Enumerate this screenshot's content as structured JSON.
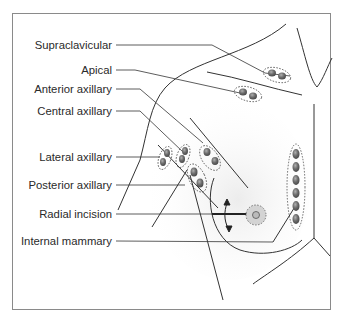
{
  "figure": {
    "labels": [
      {
        "id": "supraclavicular",
        "text": "Supraclavicular",
        "y": 45
      },
      {
        "id": "apical",
        "text": "Apical",
        "y": 70
      },
      {
        "id": "anterior-axillary",
        "text": "Anterior axillary",
        "y": 89
      },
      {
        "id": "central-axillary",
        "text": "Central axillary",
        "y": 111
      },
      {
        "id": "lateral-axillary",
        "text": "Lateral axillary",
        "y": 157
      },
      {
        "id": "posterior-axillary",
        "text": "Posterior axillary",
        "y": 185
      },
      {
        "id": "radial-incision",
        "text": "Radial incision",
        "y": 214
      },
      {
        "id": "internal-mammary",
        "text": "Internal mammary",
        "y": 241
      }
    ],
    "colors": {
      "frame": "#8a8a8a",
      "line": "#333333",
      "node_fill": "#6b6b6b",
      "node_highlight": "#a8a8a8",
      "tumor_fill": "#d0d0d0",
      "shading": "#f0f0f0"
    }
  }
}
